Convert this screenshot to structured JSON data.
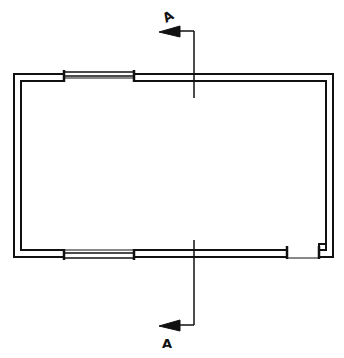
{
  "drawing": {
    "type": "floor-plan",
    "section_marker_top": "A",
    "section_marker_bottom": "A",
    "line_color": "#111111",
    "background": "#ffffff"
  }
}
